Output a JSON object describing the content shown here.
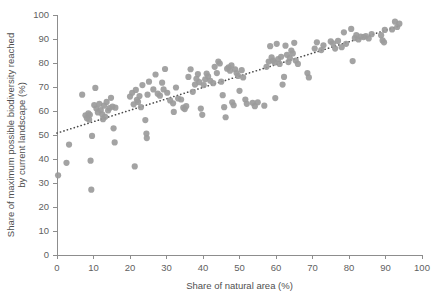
{
  "chart_data": {
    "type": "scatter",
    "title": "",
    "xlabel": "Share of natural area (%)",
    "ylabel": "Share of maximum possible biodiversity reached by current landscape (%)",
    "ylabel_line1": "Share of maximum possible biodiversity reached",
    "ylabel_line2": "by current landscape (%)",
    "xlim": [
      0,
      100
    ],
    "ylim": [
      0,
      100
    ],
    "xticks": [
      0,
      10,
      20,
      30,
      40,
      50,
      60,
      70,
      80,
      90,
      100
    ],
    "yticks": [
      0,
      10,
      20,
      30,
      40,
      50,
      60,
      70,
      80,
      90,
      100
    ],
    "grid": false,
    "legend": false,
    "point_color": "#9b9b9b",
    "point_radius_px": 3.1,
    "trendline": {
      "style": "dotted",
      "color": "#4a4a4a",
      "x": [
        0,
        94
      ],
      "y": [
        50.8,
        95.5
      ]
    },
    "points": [
      [
        0.3,
        33.2
      ],
      [
        2.6,
        38.4
      ],
      [
        3.3,
        46.0
      ],
      [
        6.9,
        66.8
      ],
      [
        7.8,
        58.2
      ],
      [
        8.2,
        57.0
      ],
      [
        8.6,
        59.0
      ],
      [
        8.8,
        56.4
      ],
      [
        9.0,
        58.4
      ],
      [
        9.2,
        39.3
      ],
      [
        9.4,
        27.2
      ],
      [
        9.6,
        49.6
      ],
      [
        10.2,
        62.5
      ],
      [
        10.5,
        69.6
      ],
      [
        10.8,
        61.0
      ],
      [
        11.2,
        59.4
      ],
      [
        11.6,
        63.0
      ],
      [
        12.0,
        60.4
      ],
      [
        12.4,
        58.6
      ],
      [
        12.6,
        56.6
      ],
      [
        12.9,
        62.2
      ],
      [
        13.2,
        57.6
      ],
      [
        13.6,
        63.8
      ],
      [
        14.0,
        60.2
      ],
      [
        14.4,
        61.2
      ],
      [
        14.8,
        65.5
      ],
      [
        15.2,
        61.8
      ],
      [
        15.5,
        52.8
      ],
      [
        15.8,
        46.9
      ],
      [
        16.0,
        61.4
      ],
      [
        20.0,
        66.0
      ],
      [
        20.6,
        67.6
      ],
      [
        21.0,
        62.8
      ],
      [
        21.3,
        36.9
      ],
      [
        21.6,
        68.8
      ],
      [
        21.9,
        64.6
      ],
      [
        22.2,
        63.8
      ],
      [
        22.6,
        66.2
      ],
      [
        23.0,
        61.6
      ],
      [
        23.4,
        70.8
      ],
      [
        24.2,
        56.2
      ],
      [
        24.5,
        50.6
      ],
      [
        24.6,
        48.7
      ],
      [
        24.8,
        66.8
      ],
      [
        25.2,
        72.2
      ],
      [
        26.4,
        69.0
      ],
      [
        27.0,
        75.2
      ],
      [
        27.6,
        67.2
      ],
      [
        28.2,
        66.4
      ],
      [
        28.8,
        71.8
      ],
      [
        29.2,
        69.0
      ],
      [
        29.6,
        77.5
      ],
      [
        30.2,
        67.6
      ],
      [
        31.0,
        64.4
      ],
      [
        31.8,
        63.2
      ],
      [
        32.0,
        59.6
      ],
      [
        32.6,
        69.8
      ],
      [
        33.2,
        65.2
      ],
      [
        34.0,
        64.8
      ],
      [
        34.6,
        61.4
      ],
      [
        35.0,
        60.8
      ],
      [
        35.4,
        62.0
      ],
      [
        36.0,
        74.2
      ],
      [
        36.6,
        77.4
      ],
      [
        37.2,
        68.0
      ],
      [
        37.8,
        71.0
      ],
      [
        38.2,
        73.4
      ],
      [
        38.6,
        75.4
      ],
      [
        39.0,
        72.0
      ],
      [
        39.4,
        61.0
      ],
      [
        39.8,
        58.4
      ],
      [
        40.2,
        70.8
      ],
      [
        40.6,
        73.2
      ],
      [
        41.0,
        75.6
      ],
      [
        41.4,
        74.4
      ],
      [
        42.0,
        72.6
      ],
      [
        42.8,
        71.6
      ],
      [
        43.2,
        78.4
      ],
      [
        43.8,
        75.8
      ],
      [
        44.2,
        80.6
      ],
      [
        44.6,
        79.8
      ],
      [
        45.0,
        72.2
      ],
      [
        45.4,
        66.6
      ],
      [
        45.8,
        61.6
      ],
      [
        46.2,
        57.4
      ],
      [
        46.6,
        77.6
      ],
      [
        47.0,
        78.2
      ],
      [
        47.4,
        76.8
      ],
      [
        47.8,
        79.0
      ],
      [
        48.0,
        63.6
      ],
      [
        48.4,
        62.4
      ],
      [
        48.8,
        77.4
      ],
      [
        49.2,
        75.8
      ],
      [
        49.6,
        74.6
      ],
      [
        50.0,
        68.4
      ],
      [
        50.6,
        77.0
      ],
      [
        51.0,
        74.0
      ],
      [
        51.6,
        64.8
      ],
      [
        52.0,
        63.0
      ],
      [
        53.6,
        63.4
      ],
      [
        54.2,
        62.0
      ],
      [
        55.0,
        63.6
      ],
      [
        56.8,
        62.2
      ],
      [
        57.4,
        78.4
      ],
      [
        58.0,
        80.6
      ],
      [
        58.4,
        87.0
      ],
      [
        58.8,
        82.4
      ],
      [
        59.2,
        81.0
      ],
      [
        59.6,
        80.2
      ],
      [
        59.8,
        65.4
      ],
      [
        60.2,
        88.0
      ],
      [
        60.6,
        81.6
      ],
      [
        61.0,
        79.6
      ],
      [
        61.4,
        82.6
      ],
      [
        61.8,
        71.0
      ],
      [
        62.2,
        74.2
      ],
      [
        62.6,
        87.2
      ],
      [
        63.0,
        83.4
      ],
      [
        63.4,
        80.4
      ],
      [
        63.8,
        82.0
      ],
      [
        64.2,
        85.2
      ],
      [
        64.6,
        84.0
      ],
      [
        65.0,
        88.4
      ],
      [
        65.4,
        81.0
      ],
      [
        66.0,
        79.6
      ],
      [
        68.6,
        75.8
      ],
      [
        69.0,
        74.0
      ],
      [
        70.6,
        86.0
      ],
      [
        71.2,
        88.6
      ],
      [
        72.4,
        85.4
      ],
      [
        73.0,
        87.4
      ],
      [
        75.0,
        89.0
      ],
      [
        75.6,
        88.2
      ],
      [
        76.2,
        86.0
      ],
      [
        77.0,
        89.2
      ],
      [
        78.0,
        86.6
      ],
      [
        78.6,
        92.8
      ],
      [
        79.2,
        88.0
      ],
      [
        80.6,
        94.2
      ],
      [
        81.0,
        80.8
      ],
      [
        81.6,
        90.4
      ],
      [
        82.0,
        91.6
      ],
      [
        82.6,
        89.8
      ],
      [
        83.2,
        91.0
      ],
      [
        84.0,
        90.8
      ],
      [
        84.6,
        91.2
      ],
      [
        85.4,
        90.2
      ],
      [
        86.2,
        92.0
      ],
      [
        88.8,
        91.6
      ],
      [
        89.2,
        89.4
      ],
      [
        89.6,
        88.6
      ],
      [
        89.8,
        93.8
      ],
      [
        91.8,
        94.0
      ],
      [
        92.6,
        97.2
      ],
      [
        93.2,
        95.0
      ],
      [
        93.8,
        96.4
      ]
    ]
  }
}
